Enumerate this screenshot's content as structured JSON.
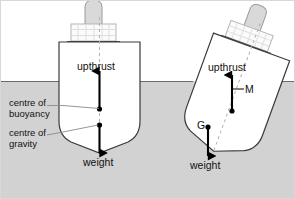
{
  "diagram": {
    "title_visible": false,
    "colors": {
      "water": "#d2d2d2",
      "water_line": "#6b6b6b",
      "hull_fill": "#ffffff",
      "hull_stroke": "#3a3a3a",
      "superstructure_fill": "#fbfbfb",
      "superstructure_stroke": "#b4b4b4",
      "funnel_fill": "#d9d9d9",
      "funnel_stroke": "#9a9a9a",
      "arrow": "#000000",
      "centreline_dash": "#b0b0b0",
      "leader_line": "#8a8a8a",
      "text": "#111111",
      "frame": "#d8d8d8"
    },
    "waterline_y": 80,
    "ships": [
      {
        "id": "upright-ship",
        "state": "upright",
        "tilt_degrees": 0,
        "labels": {
          "upthrust": "upthrust",
          "weight": "weight"
        },
        "forces": [
          {
            "name": "upthrust",
            "direction": "up",
            "applied_at": "centre of buoyancy"
          },
          {
            "name": "weight",
            "direction": "down",
            "applied_at": "centre of gravity"
          }
        ]
      },
      {
        "id": "tilted-ship",
        "state": "tilted",
        "tilt_degrees": 20,
        "labels": {
          "upthrust": "upthrust",
          "weight": "weight",
          "metacentre": "M",
          "centre_of_gravity": "G"
        },
        "forces": [
          {
            "name": "upthrust",
            "direction": "up",
            "applied_at": "M"
          },
          {
            "name": "weight",
            "direction": "down",
            "applied_at": "G"
          }
        ]
      }
    ],
    "annotations": [
      {
        "id": "centre-of-buoyancy",
        "line1": "centre of",
        "line2": "buoyancy",
        "points_to": "upright-ship-buoyancy-point"
      },
      {
        "id": "centre-of-gravity",
        "line1": "centre of",
        "line2": "gravity",
        "points_to": "upright-ship-gravity-point"
      }
    ]
  }
}
